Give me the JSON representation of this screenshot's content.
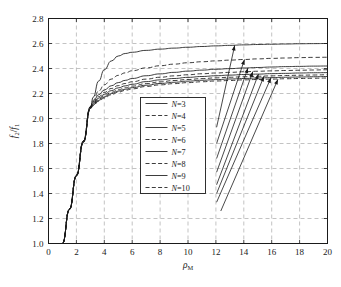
{
  "chart_data": {
    "type": "line",
    "title": "",
    "xlabel": "rho_M",
    "ylabel": "f2/f1",
    "xlim": [
      0,
      20
    ],
    "ylim": [
      1.0,
      2.8
    ],
    "xticks": [
      0,
      2,
      4,
      6,
      8,
      10,
      12,
      14,
      16,
      18,
      20
    ],
    "yticks": [
      1.0,
      1.2,
      1.4,
      1.6,
      1.8,
      2.0,
      2.2,
      2.4,
      2.6,
      2.8
    ],
    "xtick_labels": [
      "0",
      "2",
      "4",
      "6",
      "8",
      "10",
      "12",
      "14",
      "16",
      "18",
      "20"
    ],
    "ytick_labels": [
      "1.0",
      "1.2",
      "1.4",
      "1.6",
      "1.8",
      "2.0",
      "2.2",
      "2.4",
      "2.6",
      "2.8"
    ],
    "grid": true,
    "grid_style": "dashed",
    "legend_position": "center",
    "line_color": "#1a1a1a",
    "series": [
      {
        "name": "N=3",
        "n": 3,
        "style": "solid",
        "x": [
          1.0,
          1.5,
          2.0,
          2.5,
          3.0,
          3.2,
          3.6,
          4.0,
          4.5,
          5.0,
          5.5,
          6.0,
          7.0,
          8.0,
          9.0,
          10.0,
          11.0,
          12.0,
          13.0,
          14.0,
          15.0,
          16.0,
          17.0,
          18.0,
          19.0,
          20.0
        ],
        "y": [
          1.0,
          1.27,
          1.54,
          1.81,
          2.08,
          2.17,
          2.3,
          2.39,
          2.46,
          2.5,
          2.52,
          2.53,
          2.545,
          2.555,
          2.563,
          2.57,
          2.576,
          2.581,
          2.585,
          2.589,
          2.592,
          2.594,
          2.596,
          2.598,
          2.599,
          2.6
        ]
      },
      {
        "name": "N=4",
        "n": 4,
        "style": "dashed",
        "x": [
          1.0,
          1.5,
          2.0,
          2.5,
          3.0,
          3.2,
          3.6,
          4.0,
          4.5,
          5.0,
          5.5,
          6.0,
          7.0,
          8.0,
          9.0,
          10.0,
          11.0,
          12.0,
          13.0,
          14.0,
          15.0,
          16.0,
          17.0,
          18.0,
          19.0,
          20.0
        ],
        "y": [
          1.0,
          1.275,
          1.545,
          1.82,
          2.09,
          2.145,
          2.22,
          2.27,
          2.315,
          2.345,
          2.365,
          2.382,
          2.405,
          2.422,
          2.435,
          2.446,
          2.454,
          2.461,
          2.467,
          2.472,
          2.477,
          2.481,
          2.484,
          2.487,
          2.489,
          2.49
        ]
      },
      {
        "name": "N=5",
        "n": 5,
        "style": "solid",
        "x": [
          1.0,
          1.5,
          2.0,
          2.5,
          3.0,
          3.2,
          3.6,
          4.0,
          4.5,
          5.0,
          5.5,
          6.0,
          7.0,
          8.0,
          9.0,
          10.0,
          11.0,
          12.0,
          13.0,
          14.0,
          15.0,
          16.0,
          17.0,
          18.0,
          19.0,
          20.0
        ],
        "y": [
          1.0,
          1.275,
          1.545,
          1.82,
          2.095,
          2.135,
          2.19,
          2.228,
          2.262,
          2.287,
          2.305,
          2.32,
          2.342,
          2.357,
          2.369,
          2.379,
          2.387,
          2.394,
          2.399,
          2.404,
          2.408,
          2.412,
          2.415,
          2.417,
          2.419,
          2.42
        ]
      },
      {
        "name": "N=6",
        "n": 6,
        "style": "dashed",
        "x": [
          1.0,
          1.5,
          2.0,
          2.5,
          3.0,
          3.2,
          3.6,
          4.0,
          4.5,
          5.0,
          5.5,
          6.0,
          7.0,
          8.0,
          9.0,
          10.0,
          11.0,
          12.0,
          13.0,
          14.0,
          15.0,
          16.0,
          17.0,
          18.0,
          19.0,
          20.0
        ],
        "y": [
          1.0,
          1.275,
          1.545,
          1.82,
          2.095,
          2.128,
          2.175,
          2.208,
          2.24,
          2.263,
          2.28,
          2.294,
          2.315,
          2.33,
          2.341,
          2.35,
          2.358,
          2.364,
          2.369,
          2.374,
          2.378,
          2.381,
          2.384,
          2.386,
          2.388,
          2.39
        ]
      },
      {
        "name": "N=7",
        "n": 7,
        "style": "solid",
        "x": [
          1.0,
          1.5,
          2.0,
          2.5,
          3.0,
          3.2,
          3.6,
          4.0,
          4.5,
          5.0,
          5.5,
          6.0,
          7.0,
          8.0,
          9.0,
          10.0,
          11.0,
          12.0,
          13.0,
          14.0,
          15.0,
          16.0,
          17.0,
          18.0,
          19.0,
          20.0
        ],
        "y": [
          1.0,
          1.275,
          1.545,
          1.82,
          2.09,
          2.12,
          2.163,
          2.193,
          2.223,
          2.245,
          2.261,
          2.274,
          2.295,
          2.309,
          2.32,
          2.329,
          2.336,
          2.342,
          2.347,
          2.352,
          2.355,
          2.359,
          2.361,
          2.364,
          2.366,
          2.367
        ]
      },
      {
        "name": "N=8",
        "n": 8,
        "style": "dashed",
        "x": [
          1.0,
          1.5,
          2.0,
          2.5,
          3.0,
          3.2,
          3.6,
          4.0,
          4.5,
          5.0,
          5.5,
          6.0,
          7.0,
          8.0,
          9.0,
          10.0,
          11.0,
          12.0,
          13.0,
          14.0,
          15.0,
          16.0,
          17.0,
          18.0,
          19.0,
          20.0
        ],
        "y": [
          1.0,
          1.275,
          1.545,
          1.815,
          2.085,
          2.113,
          2.153,
          2.181,
          2.209,
          2.23,
          2.246,
          2.259,
          2.279,
          2.293,
          2.304,
          2.312,
          2.319,
          2.325,
          2.33,
          2.334,
          2.338,
          2.341,
          2.344,
          2.346,
          2.348,
          2.35
        ]
      },
      {
        "name": "N=9",
        "n": 9,
        "style": "solid",
        "x": [
          1.0,
          1.5,
          2.0,
          2.5,
          3.0,
          3.2,
          3.6,
          4.0,
          4.5,
          5.0,
          5.5,
          6.0,
          7.0,
          8.0,
          9.0,
          10.0,
          11.0,
          12.0,
          13.0,
          14.0,
          15.0,
          16.0,
          17.0,
          18.0,
          19.0,
          20.0
        ],
        "y": [
          1.0,
          1.272,
          1.542,
          1.812,
          2.082,
          2.108,
          2.145,
          2.172,
          2.199,
          2.219,
          2.234,
          2.247,
          2.266,
          2.28,
          2.29,
          2.299,
          2.306,
          2.311,
          2.316,
          2.32,
          2.324,
          2.327,
          2.33,
          2.332,
          2.334,
          2.336
        ]
      },
      {
        "name": "N=10",
        "n": 10,
        "style": "dashed",
        "x": [
          1.0,
          1.5,
          2.0,
          2.5,
          3.0,
          3.2,
          3.6,
          4.0,
          4.5,
          5.0,
          5.5,
          6.0,
          7.0,
          8.0,
          9.0,
          10.0,
          11.0,
          12.0,
          13.0,
          14.0,
          15.0,
          16.0,
          17.0,
          18.0,
          19.0,
          20.0
        ],
        "y": [
          1.0,
          1.272,
          1.54,
          1.808,
          2.078,
          2.103,
          2.138,
          2.164,
          2.19,
          2.21,
          2.225,
          2.237,
          2.256,
          2.269,
          2.279,
          2.287,
          2.294,
          2.3,
          2.304,
          2.309,
          2.312,
          2.315,
          2.318,
          2.32,
          2.322,
          2.324
        ]
      }
    ],
    "annotations": [
      {
        "label": "arrow-to-N3",
        "tail_x": 12.05,
        "tail_y": 1.93,
        "head_x": 13.35,
        "head_y": 2.585
      },
      {
        "label": "arrow-to-N4",
        "tail_x": 12.05,
        "tail_y": 1.8,
        "head_x": 14.05,
        "head_y": 2.472
      },
      {
        "label": "arrow-to-N5",
        "tail_x": 12.05,
        "tail_y": 1.68,
        "head_x": 14.3,
        "head_y": 2.405
      },
      {
        "label": "arrow-to-N6",
        "tail_x": 12.05,
        "tail_y": 1.57,
        "head_x": 14.65,
        "head_y": 2.376
      },
      {
        "label": "arrow-to-N7",
        "tail_x": 12.05,
        "tail_y": 1.47,
        "head_x": 15.05,
        "head_y": 2.355
      },
      {
        "label": "arrow-to-N8",
        "tail_x": 12.05,
        "tail_y": 1.4,
        "head_x": 15.45,
        "head_y": 2.339
      },
      {
        "label": "arrow-to-N9",
        "tail_x": 12.05,
        "tail_y": 1.33,
        "head_x": 15.95,
        "head_y": 2.326
      },
      {
        "label": "arrow-to-N10",
        "tail_x": 12.35,
        "tail_y": 1.26,
        "head_x": 16.45,
        "head_y": 2.314
      }
    ]
  },
  "axis": {
    "ylabel_num": "f",
    "ylabel_sub2": "2",
    "ylabel_slash": "/",
    "ylabel_den": "f",
    "ylabel_sub1": "1",
    "xlabel_rho": "ρ",
    "xlabel_sub": "M"
  }
}
